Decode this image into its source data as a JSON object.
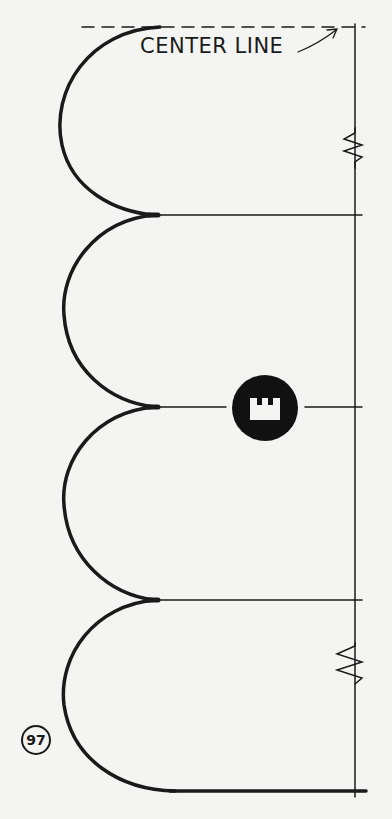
{
  "diagram": {
    "center_line_label": "CENTER LINE",
    "figure_number": "97",
    "center_badge_icon": "castle-tower-icon",
    "colors": {
      "ink": "#1a1a1a",
      "paper": "#f4f4f2"
    },
    "elements": {
      "arcs": 4,
      "horizontal_lines": [
        "y=215",
        "y=407",
        "y=600",
        "y=791"
      ],
      "springs": [
        "top-right",
        "bottom-right"
      ]
    }
  }
}
